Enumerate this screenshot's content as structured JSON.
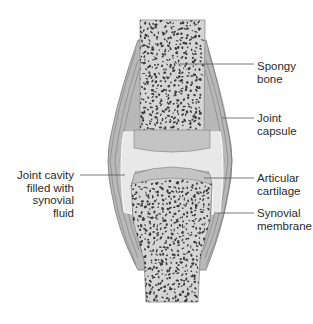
{
  "diagram": {
    "colors": {
      "bone_fill": "#d9d9d9",
      "bone_pore": "#3a3a3a",
      "cartilage": "#c8c8c8",
      "capsule": "#9a9a9a",
      "cavity": "#e6e6e6",
      "leader_line": "#555555",
      "text": "#2a2a2a"
    },
    "labels": {
      "spongy_bone": [
        "Spongy",
        "bone"
      ],
      "joint_capsule": [
        "Joint",
        "capsule"
      ],
      "articular_cartilage": [
        "Articular",
        "cartilage"
      ],
      "synovial_membrane": [
        "Synovial",
        "membrane"
      ],
      "joint_cavity": [
        "Joint cavity",
        "filled with",
        "synovial",
        "fluid"
      ]
    }
  }
}
